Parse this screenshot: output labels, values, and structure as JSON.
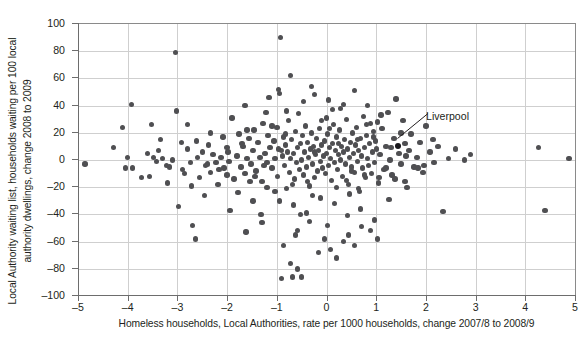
{
  "chart_data": {
    "type": "scatter",
    "title": "",
    "xlabel": "Homeless households, Local Authorities, rate per 1000 households, change 2007/8 to 2008/9",
    "ylabel_line1": "Local Authority waiting list, households waiting per 100 local",
    "ylabel_line2": "authority dwellings, change 2008 to 2009",
    "xlim": [
      -5,
      5
    ],
    "ylim": [
      -100,
      100
    ],
    "xticks": [
      -5,
      -4,
      -3,
      -2,
      -1,
      0,
      1,
      2,
      3,
      4,
      5
    ],
    "xticklabels": [
      "–5",
      "–4",
      "–3",
      "–2",
      "–1",
      "0",
      "1",
      "2",
      "3",
      "4",
      "5"
    ],
    "yticks": [
      -100,
      -80,
      -60,
      -40,
      -20,
      0,
      20,
      40,
      60,
      80,
      100
    ],
    "yticklabels": [
      "–100",
      "–80",
      "–60",
      "–40",
      "–20",
      "0",
      "20",
      "40",
      "60",
      "80",
      "100"
    ],
    "grid": "both",
    "legend": "none",
    "marker_color": "#4f4f52",
    "highlight_color": "#17161a",
    "grid_color": "#cfcfcf",
    "axis_color": "#6d6d6d",
    "background": "#ffffff",
    "annotations": [
      {
        "label": "Liverpool",
        "point": [
          1.43,
          10
        ],
        "label_xy": [
          1.98,
          24
        ]
      }
    ],
    "points": [
      [
        -4.86,
        -3
      ],
      [
        -4.28,
        9
      ],
      [
        -4.1,
        24
      ],
      [
        -4.04,
        -6
      ],
      [
        -3.92,
        41
      ],
      [
        -3.9,
        -6
      ],
      [
        -3.72,
        -13
      ],
      [
        -3.56,
        -12
      ],
      [
        -3.52,
        26
      ],
      [
        -3.48,
        2
      ],
      [
        -3.42,
        -1
      ],
      [
        -3.38,
        7
      ],
      [
        -3.3,
        1
      ],
      [
        -3.22,
        -4
      ],
      [
        -3.16,
        -5
      ],
      [
        -3.1,
        0
      ],
      [
        -3.04,
        79
      ],
      [
        -2.98,
        -34
      ],
      [
        -2.92,
        13
      ],
      [
        -2.86,
        -10
      ],
      [
        -2.8,
        26
      ],
      [
        -2.74,
        -2
      ],
      [
        -2.7,
        -48
      ],
      [
        -2.64,
        -58
      ],
      [
        -2.6,
        2
      ],
      [
        -2.56,
        -13
      ],
      [
        -2.5,
        6
      ],
      [
        -2.44,
        -4
      ],
      [
        -2.38,
        11
      ],
      [
        -2.34,
        -9
      ],
      [
        -2.28,
        4
      ],
      [
        -2.22,
        -2
      ],
      [
        -2.18,
        -18
      ],
      [
        -2.12,
        2
      ],
      [
        -2.06,
        -6
      ],
      [
        -2.0,
        9
      ],
      [
        -1.96,
        -1
      ],
      [
        -1.9,
        31
      ],
      [
        -1.86,
        -14
      ],
      [
        -1.8,
        3
      ],
      [
        -1.76,
        19
      ],
      [
        -1.72,
        -5
      ],
      [
        -1.68,
        10
      ],
      [
        -1.64,
        -10
      ],
      [
        -1.6,
        1
      ],
      [
        -1.56,
        16
      ],
      [
        -1.52,
        -3
      ],
      [
        -1.48,
        7
      ],
      [
        -1.46,
        22
      ],
      [
        -1.42,
        -8
      ],
      [
        -1.38,
        13
      ],
      [
        -1.34,
        2
      ],
      [
        -1.3,
        -16
      ],
      [
        -1.28,
        27
      ],
      [
        -1.24,
        5
      ],
      [
        -1.2,
        -2
      ],
      [
        -1.18,
        18
      ],
      [
        -1.14,
        9
      ],
      [
        -1.1,
        -6
      ],
      [
        -1.06,
        14
      ],
      [
        -1.04,
        1
      ],
      [
        -1.0,
        24
      ],
      [
        -0.98,
        -12
      ],
      [
        -0.96,
        8
      ],
      [
        -0.94,
        -30
      ],
      [
        -0.92,
        90
      ],
      [
        -0.9,
        -87
      ],
      [
        -0.88,
        3
      ],
      [
        -0.86,
        17
      ],
      [
        -0.84,
        -4
      ],
      [
        -0.82,
        11
      ],
      [
        -0.8,
        -21
      ],
      [
        -0.78,
        6
      ],
      [
        -0.76,
        29
      ],
      [
        -0.74,
        -9
      ],
      [
        -0.72,
        1
      ],
      [
        -0.7,
        15
      ],
      [
        -0.68,
        -86
      ],
      [
        -0.66,
        5
      ],
      [
        -0.64,
        -14
      ],
      [
        -0.62,
        21
      ],
      [
        -0.6,
        -2
      ],
      [
        -0.58,
        9
      ],
      [
        -0.56,
        34
      ],
      [
        -0.54,
        -7
      ],
      [
        -0.52,
        12
      ],
      [
        -0.5,
        0
      ],
      [
        -0.48,
        18
      ],
      [
        -0.46,
        -11
      ],
      [
        -0.44,
        6
      ],
      [
        -0.42,
        25
      ],
      [
        -0.4,
        -5
      ],
      [
        -0.38,
        13
      ],
      [
        -0.36,
        2
      ],
      [
        -0.34,
        -19
      ],
      [
        -0.32,
        8
      ],
      [
        -0.3,
        20
      ],
      [
        -0.28,
        -3
      ],
      [
        -0.26,
        10
      ],
      [
        -0.24,
        -13
      ],
      [
        -0.22,
        4
      ],
      [
        -0.2,
        16
      ],
      [
        -0.18,
        -8
      ],
      [
        -0.16,
        7
      ],
      [
        -0.14,
        23
      ],
      [
        -0.12,
        -1
      ],
      [
        -0.1,
        11
      ],
      [
        -0.08,
        -6
      ],
      [
        -0.06,
        3
      ],
      [
        -0.04,
        14
      ],
      [
        -0.02,
        -10
      ],
      [
        0.0,
        5
      ],
      [
        0.02,
        19
      ],
      [
        0.04,
        -4
      ],
      [
        0.06,
        9
      ],
      [
        0.08,
        1
      ],
      [
        0.1,
        -15
      ],
      [
        0.12,
        12
      ],
      [
        0.14,
        26
      ],
      [
        0.16,
        -2
      ],
      [
        0.18,
        7
      ],
      [
        0.2,
        17
      ],
      [
        0.22,
        -7
      ],
      [
        0.24,
        4
      ],
      [
        0.26,
        22
      ],
      [
        0.28,
        0
      ],
      [
        0.3,
        10
      ],
      [
        0.32,
        -12
      ],
      [
        0.34,
        6
      ],
      [
        0.36,
        15
      ],
      [
        0.38,
        -3
      ],
      [
        0.4,
        30
      ],
      [
        0.42,
        8
      ],
      [
        0.44,
        -18
      ],
      [
        0.46,
        2
      ],
      [
        0.48,
        13
      ],
      [
        0.5,
        -5
      ],
      [
        0.52,
        20
      ],
      [
        0.54,
        5
      ],
      [
        0.56,
        -9
      ],
      [
        0.58,
        11
      ],
      [
        0.6,
        24
      ],
      [
        0.62,
        -1
      ],
      [
        0.64,
        7
      ],
      [
        0.66,
        -23
      ],
      [
        0.68,
        16
      ],
      [
        0.7,
        3
      ],
      [
        0.72,
        -6
      ],
      [
        0.74,
        32
      ],
      [
        0.76,
        9
      ],
      [
        0.78,
        -13
      ],
      [
        0.8,
        18
      ],
      [
        0.82,
        1
      ],
      [
        0.84,
        -4
      ],
      [
        0.86,
        12
      ],
      [
        0.88,
        27
      ],
      [
        0.9,
        -10
      ],
      [
        0.92,
        6
      ],
      [
        0.94,
        21
      ],
      [
        0.96,
        -2
      ],
      [
        0.98,
        14
      ],
      [
        1.0,
        8
      ],
      [
        1.04,
        -17
      ],
      [
        1.08,
        4
      ],
      [
        1.12,
        23
      ],
      [
        1.16,
        -7
      ],
      [
        1.2,
        10
      ],
      [
        1.24,
        35
      ],
      [
        1.28,
        0
      ],
      [
        1.32,
        -11
      ],
      [
        1.36,
        16
      ],
      [
        1.43,
        10
      ],
      [
        1.46,
        5
      ],
      [
        1.5,
        -3
      ],
      [
        1.54,
        29
      ],
      [
        1.58,
        12
      ],
      [
        1.62,
        -20
      ],
      [
        1.66,
        7
      ],
      [
        1.7,
        19
      ],
      [
        1.76,
        -5
      ],
      [
        1.82,
        2
      ],
      [
        1.88,
        13
      ],
      [
        1.94,
        -9
      ],
      [
        2.0,
        25
      ],
      [
        2.08,
        6
      ],
      [
        2.16,
        -2
      ],
      [
        2.24,
        10
      ],
      [
        2.34,
        -38
      ],
      [
        2.46,
        1
      ],
      [
        2.6,
        8
      ],
      [
        2.78,
        0
      ],
      [
        2.9,
        4
      ],
      [
        4.26,
        9
      ],
      [
        4.4,
        -37
      ],
      [
        4.88,
        1
      ],
      [
        -3.02,
        36
      ],
      [
        -2.46,
        -26
      ],
      [
        -1.94,
        -37
      ],
      [
        -1.64,
        40
      ],
      [
        -1.32,
        -40
      ],
      [
        -1.16,
        46
      ],
      [
        -0.96,
        52
      ],
      [
        -0.86,
        -63
      ],
      [
        -0.72,
        62
      ],
      [
        -0.58,
        -52
      ],
      [
        -0.46,
        43
      ],
      [
        -0.34,
        -45
      ],
      [
        -0.24,
        48
      ],
      [
        -0.12,
        -28
      ],
      [
        0.04,
        44
      ],
      [
        0.16,
        -32
      ],
      [
        0.28,
        38
      ],
      [
        0.42,
        -41
      ],
      [
        0.56,
        51
      ],
      [
        0.68,
        -36
      ],
      [
        0.82,
        40
      ],
      [
        0.96,
        -44
      ],
      [
        1.1,
        33
      ],
      [
        1.26,
        -29
      ],
      [
        1.4,
        45
      ],
      [
        -2.9,
        -7
      ],
      [
        -2.34,
        20
      ],
      [
        -1.78,
        -24
      ],
      [
        -1.22,
        35
      ],
      [
        -0.66,
        -33
      ],
      [
        -0.1,
        29
      ],
      [
        0.46,
        -25
      ],
      [
        1.02,
        28
      ],
      [
        1.58,
        -16
      ],
      [
        2.14,
        15
      ],
      [
        -4.0,
        2
      ],
      [
        -3.6,
        5
      ],
      [
        -3.2,
        -17
      ],
      [
        -2.8,
        8
      ],
      [
        -2.4,
        -3
      ],
      [
        -2.0,
        -11
      ],
      [
        -1.6,
        22
      ],
      [
        -1.2,
        -20
      ],
      [
        -0.8,
        36
      ],
      [
        -0.4,
        -39
      ],
      [
        0.0,
        31
      ],
      [
        0.4,
        -15
      ],
      [
        0.8,
        26
      ],
      [
        1.2,
        -6
      ],
      [
        1.6,
        3
      ],
      [
        -0.94,
        49
      ],
      [
        -0.62,
        -55
      ],
      [
        -0.3,
        54
      ],
      [
        0.02,
        -48
      ],
      [
        0.34,
        41
      ],
      [
        -1.48,
        -30
      ],
      [
        -1.04,
        -23
      ],
      [
        -0.52,
        -40
      ],
      [
        0.12,
        37
      ],
      [
        0.64,
        -21
      ],
      [
        -2.62,
        14
      ],
      [
        -2.16,
        -7
      ],
      [
        -1.7,
        12
      ],
      [
        -1.26,
        -4
      ],
      [
        -0.82,
        19
      ],
      [
        -0.38,
        -16
      ],
      [
        0.06,
        23
      ],
      [
        0.5,
        -8
      ],
      [
        0.94,
        17
      ],
      [
        1.38,
        -14
      ],
      [
        -3.34,
        15
      ],
      [
        -2.72,
        -19
      ],
      [
        -2.08,
        17
      ],
      [
        -1.44,
        -12
      ],
      [
        -0.9,
        7
      ],
      [
        -0.28,
        -26
      ],
      [
        0.24,
        12
      ],
      [
        0.76,
        -11
      ],
      [
        1.3,
        9
      ],
      [
        1.84,
        -6
      ],
      [
        -1.98,
        6
      ],
      [
        -1.54,
        -16
      ],
      [
        -1.1,
        25
      ],
      [
        -0.68,
        -18
      ],
      [
        -0.24,
        6
      ],
      [
        0.2,
        -20
      ],
      [
        0.62,
        15
      ],
      [
        1.06,
        -13
      ],
      [
        1.5,
        20
      ],
      [
        1.96,
        -4
      ],
      [
        -0.72,
        -76
      ],
      [
        -0.58,
        -80
      ],
      [
        -0.5,
        -86
      ],
      [
        0.08,
        -66
      ],
      [
        0.2,
        -72
      ],
      [
        0.34,
        -60
      ],
      [
        -0.16,
        -68
      ],
      [
        -0.04,
        -58
      ],
      [
        0.44,
        -55
      ],
      [
        0.56,
        -63
      ],
      [
        -1.3,
        -46
      ],
      [
        -1.62,
        -53
      ],
      [
        0.7,
        -49
      ],
      [
        0.88,
        -52
      ],
      [
        1.02,
        -58
      ]
    ]
  }
}
